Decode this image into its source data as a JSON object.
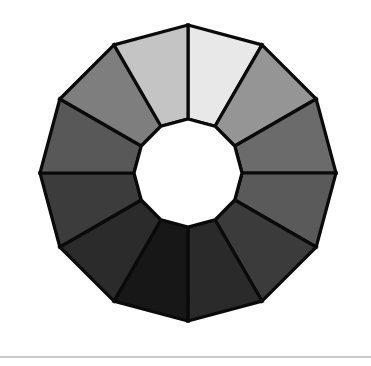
{
  "figure": {
    "width": 371,
    "height": 366,
    "background_color": "#ffffff",
    "outline_color": "#0a0a0a",
    "outline_width": 3.2,
    "hub_color": "#ffffff",
    "footer_rule": {
      "color": "#c9c9c9",
      "y": 356,
      "height": 2
    }
  },
  "chart_data": {
    "type": "pie",
    "subtitle": "",
    "xlabel": "",
    "ylabel": "",
    "variant": "donut-polygon",
    "segment_count": 12,
    "equal_segments": true,
    "start_angle_deg": -90,
    "direction": "clockwise",
    "inner_radius_px": 54,
    "outer_radius_px": 148,
    "center_x_px": 188,
    "center_y_px": 173,
    "polygon_sides_outer": 12,
    "polygon_sides_inner": 12,
    "grid": false,
    "legend_position": "none",
    "annotations": [],
    "categories": [
      "Segment 1",
      "Segment 2",
      "Segment 3",
      "Segment 4",
      "Segment 5",
      "Segment 6",
      "Segment 7",
      "Segment 8",
      "Segment 9",
      "Segment 10",
      "Segment 11",
      "Segment 12"
    ],
    "values": [
      8.3333,
      8.3333,
      8.3333,
      8.3333,
      8.3333,
      8.3333,
      8.3333,
      8.3333,
      8.3333,
      8.3333,
      8.3333,
      8.3333
    ],
    "colors": [
      "#e8e8e8",
      "#959595",
      "#6b6b6b",
      "#5a5a5a",
      "#3b3b3b",
      "#2a2a2a",
      "#171717",
      "#2b2b2b",
      "#3c3c3c",
      "#585858",
      "#7e7e7e",
      "#c4c4c4"
    ],
    "gray_levels": [
      232,
      149,
      107,
      90,
      59,
      42,
      23,
      43,
      60,
      88,
      126,
      196
    ],
    "tick_labels": [],
    "axis_range": null
  }
}
